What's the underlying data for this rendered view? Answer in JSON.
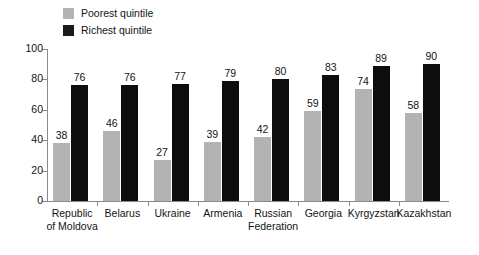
{
  "chart_data": {
    "type": "bar",
    "title": "",
    "subtitle": "",
    "xlabel": "",
    "ylabel": "",
    "ylim": [
      0,
      100
    ],
    "yticks": [
      0,
      20,
      40,
      60,
      80,
      100
    ],
    "grid": false,
    "legend_position": "top-left",
    "categories": [
      "Republic of Moldova",
      "Belarus",
      "Ukraine",
      "Armenia",
      "Russian Federation",
      "Georgia",
      "Kyrgyzstan",
      "Kazakhstan"
    ],
    "category_lines": [
      [
        "Republic",
        "of Moldova"
      ],
      [
        "Belarus"
      ],
      [
        "Ukraine"
      ],
      [
        "Armenia"
      ],
      [
        "Russian",
        "Federation"
      ],
      [
        "Georgia"
      ],
      [
        "Kyrgyzstan"
      ],
      [
        "Kazakhstan"
      ]
    ],
    "series": [
      {
        "name": "Poorest quintile",
        "color": "#b3b3b3",
        "values": [
          38,
          46,
          27,
          39,
          42,
          59,
          74,
          58
        ]
      },
      {
        "name": "Richest quintile",
        "color": "#0d0d0d",
        "values": [
          76,
          76,
          77,
          79,
          80,
          83,
          89,
          90
        ]
      }
    ]
  },
  "legend": {
    "items": [
      {
        "label": "Poorest quintile",
        "swatch": "#b3b3b3"
      },
      {
        "label": "Richest quintile",
        "swatch": "#0d0d0d"
      }
    ]
  },
  "axis": {
    "y_tick_labels": [
      "100",
      "80",
      "60",
      "40",
      "20",
      "0"
    ]
  }
}
